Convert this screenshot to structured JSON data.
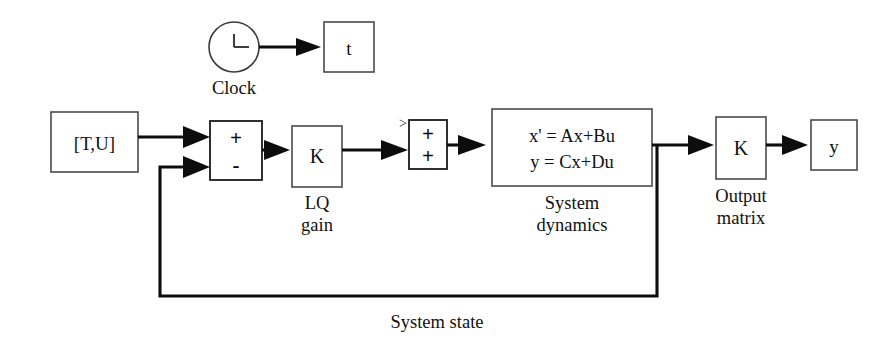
{
  "diagram": {
    "type": "simulink-block-diagram",
    "blocks": {
      "clock": {
        "label": "Clock",
        "icon": "clock-icon",
        "caption": "Clock"
      },
      "time_output": {
        "label": "t"
      },
      "source": {
        "label": "[T,U]"
      },
      "sum1": {
        "sign_top": "+",
        "sign_bottom": "-"
      },
      "lq_gain": {
        "label": "K",
        "caption_line1": "LQ",
        "caption_line2": "gain"
      },
      "sum2": {
        "sign_top": "+",
        "sign_bottom": "+",
        "port_marker": ">"
      },
      "system_dynamics": {
        "equation_line1": "x' = Ax+Bu",
        "equation_line2": "y = Cx+Du",
        "caption_line1": "System",
        "caption_line2": "dynamics"
      },
      "output_matrix": {
        "label": "K",
        "caption_line1": "Output",
        "caption_line2": "matrix"
      },
      "output_signal": {
        "label": "y"
      }
    },
    "signals": {
      "feedback_label": "System state"
    },
    "colors": {
      "wire": "#0d0d0d",
      "block_stroke": "#4a4a4a",
      "background": "#ffffff",
      "text": "#111111"
    }
  }
}
